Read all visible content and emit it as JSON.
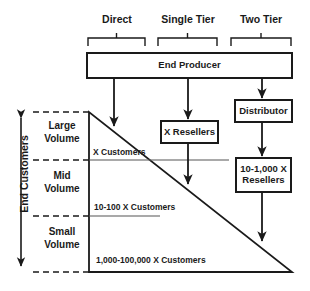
{
  "diagram": {
    "colors": {
      "stroke": "#1a1a1a",
      "background": "#ffffff",
      "dashed": "#1a1a1a",
      "text": "#1a1a1a"
    },
    "channel_headers": [
      {
        "label": "Direct"
      },
      {
        "label": "Single Tier"
      },
      {
        "label": "Two Tier"
      }
    ],
    "boxes": [
      {
        "label": "End Producer"
      },
      {
        "label": "X Resellers"
      },
      {
        "label": "Distributor"
      },
      {
        "label": "10-1,000 X Resellers"
      }
    ],
    "axis": {
      "label": "End Customers"
    },
    "tiers": [
      {
        "name": "Large\nVolume",
        "line1": "Large",
        "line2": "Volume",
        "customers": "X Customers"
      },
      {
        "name": "Mid\nVolume",
        "line1": "Mid",
        "line2": "Volume",
        "customers": "10-100 X Customers"
      },
      {
        "name": "Small\nVolume",
        "line1": "Small",
        "line2": "Volume",
        "customers": "1,000-100,000 X Customers"
      }
    ]
  }
}
